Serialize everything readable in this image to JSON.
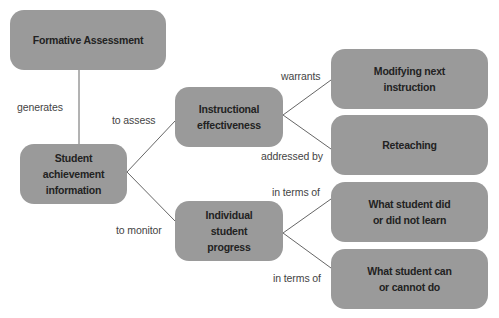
{
  "diagram": {
    "type": "concept-map",
    "colors": {
      "node_fill": "#9a9a9a",
      "node_text": "#222222",
      "edge_line": "#666666",
      "edge_label": "#444444",
      "background": "#ffffff"
    },
    "nodes": {
      "formative_assessment": {
        "label": "Formative Assessment"
      },
      "student_achievement": {
        "label": "Student\nachievement\ninformation"
      },
      "instructional_effectiveness": {
        "label": "Instructional\neffectiveness"
      },
      "individual_progress": {
        "label": "Individual\nstudent\nprogress"
      },
      "modifying_instruction": {
        "label": "Modifying next\ninstruction"
      },
      "reteaching": {
        "label": "Reteaching"
      },
      "did_not_learn": {
        "label": "What student did\nor did not learn"
      },
      "cannot_do": {
        "label": "What student can\nor cannot do"
      }
    },
    "edges": [
      {
        "from": "formative_assessment",
        "to": "student_achievement",
        "label": "generates"
      },
      {
        "from": "student_achievement",
        "to": "instructional_effectiveness",
        "label": "to assess"
      },
      {
        "from": "student_achievement",
        "to": "individual_progress",
        "label": "to monitor"
      },
      {
        "from": "instructional_effectiveness",
        "to": "modifying_instruction",
        "label": "warrants"
      },
      {
        "from": "instructional_effectiveness",
        "to": "reteaching",
        "label": "addressed by"
      },
      {
        "from": "individual_progress",
        "to": "did_not_learn",
        "label": "in terms of"
      },
      {
        "from": "individual_progress",
        "to": "cannot_do",
        "label": "in terms of"
      }
    ]
  }
}
